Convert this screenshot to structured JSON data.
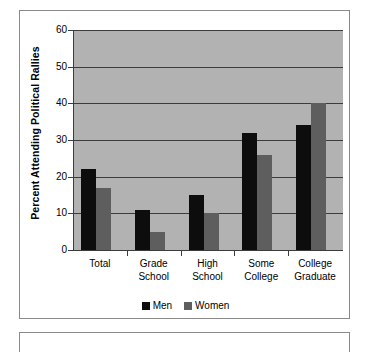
{
  "chart_data": {
    "type": "bar",
    "title": "",
    "subtitle": "",
    "xlabel": "",
    "ylabel": "Percent Attending Political Rallies",
    "ylim": [
      0,
      60
    ],
    "yticks": [
      0,
      10,
      20,
      30,
      40,
      50,
      60
    ],
    "ytick_labels": [
      "0",
      "10",
      "20",
      "30",
      "40",
      "50",
      "60"
    ],
    "grid": true,
    "legend_position": "bottom",
    "categories": [
      "Total",
      "Grade School",
      "High School",
      "Some College",
      "College Graduate"
    ],
    "category_lines": [
      [
        "Total"
      ],
      [
        "Grade",
        "School"
      ],
      [
        "High",
        "School"
      ],
      [
        "Some",
        "College"
      ],
      [
        "College",
        "Graduate"
      ]
    ],
    "series": [
      {
        "name": "Men",
        "color": "#0d0d0d",
        "values": [
          22,
          11,
          15,
          32,
          34
        ]
      },
      {
        "name": "Women",
        "color": "#5e5e5e",
        "values": [
          17,
          5,
          10,
          26,
          40
        ]
      }
    ]
  },
  "legend": {
    "items": [
      {
        "label": "Men",
        "color": "#0d0d0d"
      },
      {
        "label": "Women",
        "color": "#5e5e5e"
      }
    ]
  },
  "colors": {
    "plot_background": "#b2b2b2",
    "gridline": "#3c3c3c",
    "axis": "#3c3c3c",
    "panel_border": "#8a8a8a",
    "page_background": "#ffffff",
    "text": "#000000"
  }
}
